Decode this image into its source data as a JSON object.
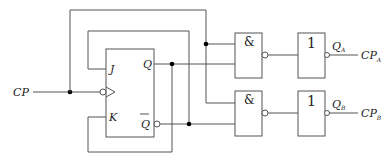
{
  "diagram": {
    "type": "logic-circuit",
    "input_label": "CP",
    "flip_flop": {
      "type": "JK",
      "inputs": [
        "J",
        "K"
      ],
      "clock": "falling-edge",
      "outputs": [
        "Q",
        "Q̄"
      ],
      "pin_labels": {
        "j": "J",
        "k": "K",
        "q": "Q",
        "qbar": "Q"
      }
    },
    "gates": [
      {
        "id": "nand-a",
        "symbol": "&",
        "inputs": [
          "CP",
          "Q"
        ]
      },
      {
        "id": "nand-b",
        "symbol": "&",
        "inputs": [
          "CP",
          "Q̄"
        ]
      },
      {
        "id": "not-a",
        "symbol": "1",
        "input": "nand-a"
      },
      {
        "id": "not-b",
        "symbol": "1",
        "input": "nand-b"
      }
    ],
    "outputs": [
      {
        "signal": "Q",
        "subscript": "A",
        "cp": "CP",
        "cp_subscript": "A"
      },
      {
        "signal": "Q",
        "subscript": "B",
        "cp": "CP",
        "cp_subscript": "B"
      }
    ],
    "feedback": [
      "Q̄ → J",
      "Q → K"
    ]
  }
}
